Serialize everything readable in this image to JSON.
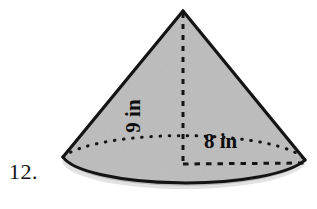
{
  "figure": {
    "name": "cone-diagram",
    "problem_number": "12.",
    "shape": "cone",
    "labels": {
      "height": "9 in",
      "radius": "8 in"
    },
    "colors": {
      "background": "#ffffff",
      "fill": "#c9c9c9",
      "outline": "#141414",
      "text": "#0d0d0d"
    },
    "geometry": {
      "apex_x": 183,
      "apex_y": 11,
      "center_x": 183,
      "center_y": 163,
      "left_x": 62,
      "right_x": 306,
      "base_bottom_y": 189
    }
  }
}
